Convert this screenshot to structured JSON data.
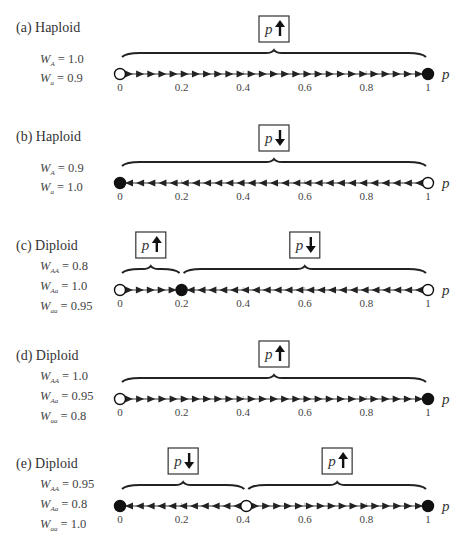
{
  "axis": {
    "label": "p",
    "ticks": [
      "0",
      "0.2",
      "0.4",
      "0.6",
      "0.8",
      "1"
    ]
  },
  "panels": [
    {
      "id": "a",
      "title": "(a)  Haploid",
      "fitness": [
        {
          "sym": "W",
          "sub": "A",
          "val": "= 1.0"
        },
        {
          "sym": "W",
          "sub": "a",
          "val": "= 0.9"
        }
      ],
      "equilibria": [
        {
          "p": 0,
          "type": "unstable"
        },
        {
          "p": 1,
          "type": "stable"
        }
      ],
      "regions": [
        {
          "from": 0,
          "to": 1,
          "direction": "increase",
          "box": "p↑"
        }
      ]
    },
    {
      "id": "b",
      "title": "(b)  Haploid",
      "fitness": [
        {
          "sym": "W",
          "sub": "A",
          "val": "= 0.9"
        },
        {
          "sym": "W",
          "sub": "a",
          "val": "= 1.0"
        }
      ],
      "equilibria": [
        {
          "p": 0,
          "type": "stable"
        },
        {
          "p": 1,
          "type": "unstable"
        }
      ],
      "regions": [
        {
          "from": 0,
          "to": 1,
          "direction": "decrease",
          "box": "p↓"
        }
      ]
    },
    {
      "id": "c",
      "title": "(c)  Diploid",
      "fitness": [
        {
          "sym": "W",
          "sub": "AA",
          "val": "= 0.8"
        },
        {
          "sym": "W",
          "sub": "Aa",
          "val": "= 1.0"
        },
        {
          "sym": "W",
          "sub": "aa",
          "val": "= 0.95"
        }
      ],
      "equilibria": [
        {
          "p": 0,
          "type": "unstable"
        },
        {
          "p": 0.2,
          "type": "stable"
        },
        {
          "p": 1,
          "type": "unstable"
        }
      ],
      "regions": [
        {
          "from": 0,
          "to": 0.2,
          "direction": "increase",
          "box": "p↑"
        },
        {
          "from": 0.2,
          "to": 1,
          "direction": "decrease",
          "box": "p↓"
        }
      ]
    },
    {
      "id": "d",
      "title": "(d)  Diploid",
      "fitness": [
        {
          "sym": "W",
          "sub": "AA",
          "val": "= 1.0"
        },
        {
          "sym": "W",
          "sub": "Aa",
          "val": "= 0.95"
        },
        {
          "sym": "W",
          "sub": "aa",
          "val": "= 0.8"
        }
      ],
      "equilibria": [
        {
          "p": 0,
          "type": "unstable"
        },
        {
          "p": 1,
          "type": "stable"
        }
      ],
      "regions": [
        {
          "from": 0,
          "to": 1,
          "direction": "increase",
          "box": "p↑"
        }
      ]
    },
    {
      "id": "e",
      "title": "(e)  Diploid",
      "fitness": [
        {
          "sym": "W",
          "sub": "AA",
          "val": "= 0.95"
        },
        {
          "sym": "W",
          "sub": "Aa",
          "val": "= 0.8"
        },
        {
          "sym": "W",
          "sub": "aa",
          "val": "= 1.0"
        }
      ],
      "equilibria": [
        {
          "p": 0,
          "type": "stable"
        },
        {
          "p": 0.41,
          "type": "unstable"
        },
        {
          "p": 1,
          "type": "stable"
        }
      ],
      "regions": [
        {
          "from": 0,
          "to": 0.41,
          "direction": "decrease",
          "box": "p↓"
        },
        {
          "from": 0.41,
          "to": 1,
          "direction": "increase",
          "box": "p↑"
        }
      ]
    }
  ]
}
